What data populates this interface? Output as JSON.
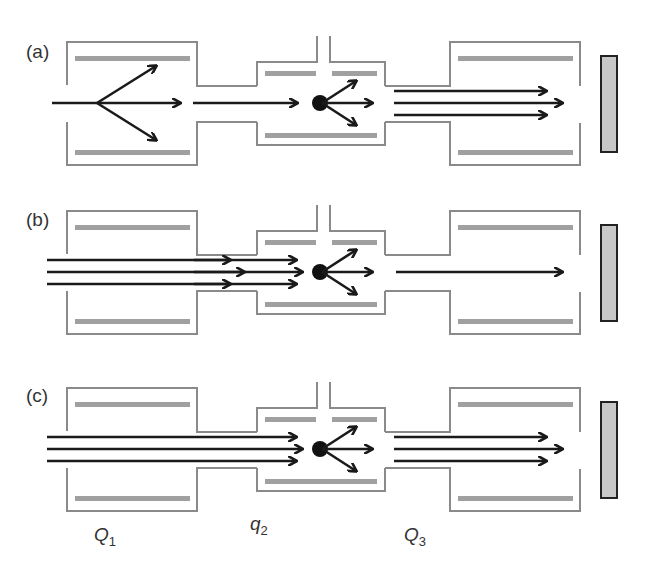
{
  "figure": {
    "panels": [
      {
        "label": "(a)",
        "mode": "product-ion scan",
        "q1_beam": "single",
        "q2_fragments": 3,
        "q3_beam": "multiple"
      },
      {
        "label": "(b)",
        "mode": "precursor-ion scan",
        "q1_beam": "multiple",
        "q2_fragments": 3,
        "q3_beam": "single"
      },
      {
        "label": "(c)",
        "mode": "neutral-loss scan",
        "q1_beam": "multiple",
        "q2_fragments": 3,
        "q3_beam": "multiple"
      }
    ],
    "stage_labels": {
      "q1": {
        "main": "Q",
        "sub": "1"
      },
      "q2": {
        "main": "q",
        "sub": "2"
      },
      "q3": {
        "main": "Q",
        "sub": "3"
      }
    },
    "colors": {
      "housing": "#8a8a8a",
      "rod": "#a0a0a0",
      "arrow": "#1a1a1a",
      "detector_fill": "#c8c8c8",
      "detector_stroke": "#222222"
    }
  }
}
